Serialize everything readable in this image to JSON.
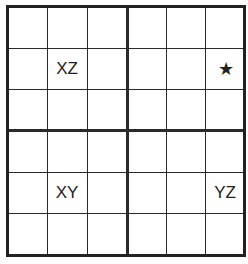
{
  "grid": {
    "rows": 6,
    "cols": 6,
    "box_rows": 2,
    "box_cols": 2,
    "cells": [
      {
        "row": 1,
        "col": 1,
        "label": "XZ"
      },
      {
        "row": 1,
        "col": 5,
        "label": "★",
        "icon": "star-icon"
      },
      {
        "row": 4,
        "col": 1,
        "label": "XY"
      },
      {
        "row": 4,
        "col": 5,
        "label": "YZ"
      }
    ]
  }
}
